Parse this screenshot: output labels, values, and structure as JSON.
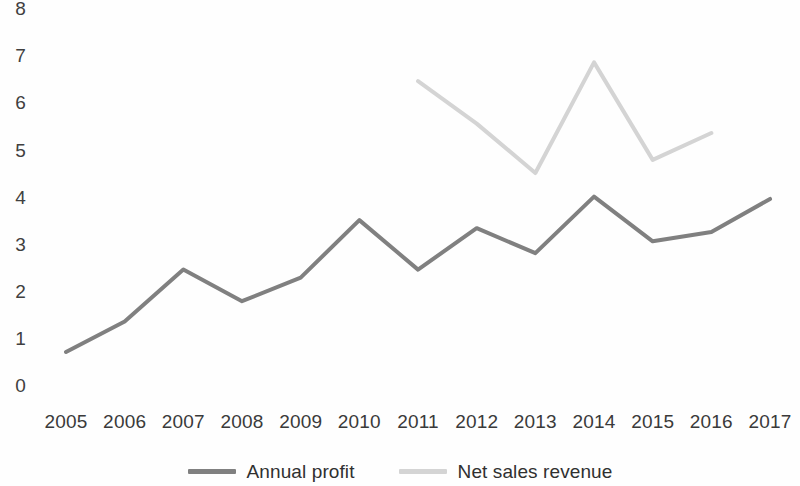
{
  "chart_data": {
    "type": "line",
    "title": "",
    "xlabel": "",
    "ylabel": "",
    "categories": [
      "2005",
      "2006",
      "2007",
      "2008",
      "2009",
      "2010",
      "2011",
      "2012",
      "2013",
      "2014",
      "2015",
      "2016",
      "2017"
    ],
    "ylim": [
      0,
      8
    ],
    "yticks": [
      0,
      1,
      2,
      3,
      4,
      5,
      6,
      7,
      8
    ],
    "ytick_labels": [
      "0",
      "1",
      "2",
      "3",
      "4",
      "5",
      "6",
      "7",
      "8"
    ],
    "grid": false,
    "legend_position": "bottom",
    "series": [
      {
        "name": "Annual profit",
        "color": "#808080",
        "values": [
          0.7,
          1.35,
          2.45,
          1.78,
          2.28,
          3.5,
          2.45,
          3.33,
          2.8,
          4.0,
          3.05,
          3.25,
          3.95
        ]
      },
      {
        "name": "Net sales revenue",
        "color": "#d4d4d4",
        "values": [
          null,
          null,
          null,
          null,
          null,
          null,
          6.45,
          5.55,
          4.5,
          6.85,
          4.78,
          5.35,
          null
        ]
      }
    ]
  },
  "legend": {
    "entries": [
      {
        "label": "Annual profit",
        "color": "#808080",
        "marker": "line-swatch"
      },
      {
        "label": "Net sales revenue",
        "color": "#d4d4d4",
        "marker": "line-swatch"
      }
    ]
  },
  "layout": {
    "plot_left": 66,
    "plot_right": 770,
    "y_zero_px": 385,
    "y_unit_px": 47.1,
    "x_step_px": 58.67
  }
}
